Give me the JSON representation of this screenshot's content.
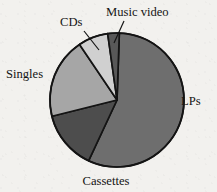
{
  "figure": {
    "type": "pie-chart",
    "title": "",
    "background_color": "#f2f1ee",
    "outline_color": "#141414"
  },
  "geometry": {
    "center_x": 117,
    "center_y": 100,
    "radius": 67
  },
  "chart_data": {
    "type": "pie",
    "title": "",
    "xlabel": "",
    "ylabel": "",
    "legend_position": "none",
    "grid": false,
    "labels": [
      "LPs",
      "Cassettes",
      "Singles",
      "CDs",
      "Music video"
    ],
    "values": [
      56,
      14,
      19,
      7,
      3
    ],
    "units": "percent",
    "start_angle_deg": 2,
    "direction": "clockwise",
    "slices": [
      {
        "label": "LPs",
        "value": 56,
        "color": "#6e6e6e",
        "start_angle_deg": 2,
        "end_angle_deg": 205,
        "label_x": 181,
        "label_y": 105,
        "label_anchor": "start",
        "has_leader_line": false
      },
      {
        "label": "Cassettes",
        "value": 14,
        "color": "#4d4d4d",
        "start_angle_deg": 205,
        "end_angle_deg": 256,
        "label_x": 106,
        "label_y": 185,
        "label_anchor": "middle",
        "has_leader_line": false
      },
      {
        "label": "Singles",
        "value": 19,
        "color": "#a6a6a6",
        "start_angle_deg": 256,
        "end_angle_deg": 326,
        "label_x": 6,
        "label_y": 78,
        "label_anchor": "start",
        "has_leader_line": false
      },
      {
        "label": "CDs",
        "value": 7,
        "color": "#d0d0d0",
        "start_angle_deg": 326,
        "end_angle_deg": 352,
        "label_x": 60,
        "label_y": 26,
        "label_anchor": "start",
        "has_leader_line": true,
        "leader": {
          "x1": 84,
          "y1": 31,
          "x2": 99,
          "y2": 50
        }
      },
      {
        "label": "Music video",
        "value": 3,
        "color": "#585858",
        "start_angle_deg": 352,
        "end_angle_deg": 2,
        "label_x": 106,
        "label_y": 16,
        "label_anchor": "start",
        "has_leader_line": true,
        "leader": {
          "x1": 124,
          "y1": 21,
          "x2": 114,
          "y2": 43
        }
      }
    ]
  }
}
